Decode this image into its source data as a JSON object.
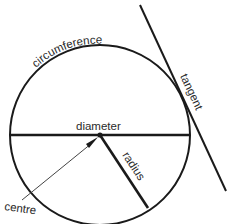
{
  "diagram": {
    "labels": {
      "circumference": "circumference",
      "tangent": "tangent",
      "diameter": "diameter",
      "radius": "radius",
      "centre": "centre"
    },
    "colors": {
      "line": "#1a1a1a",
      "pointer": "#444444",
      "background": "#ffffff"
    }
  }
}
